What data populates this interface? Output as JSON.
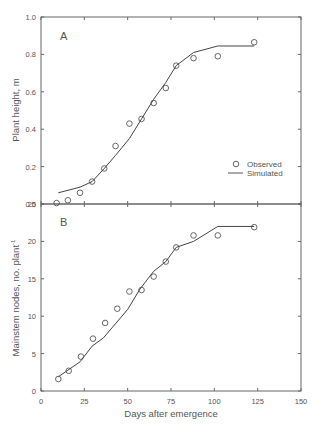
{
  "chart_data": [
    {
      "panel": "A",
      "type": "scatter+line",
      "ylabel": "Plant height, m",
      "xlabel": "Days after emergence",
      "xlim": [
        0,
        150
      ],
      "ylim": [
        0,
        1.0
      ],
      "yticks": [
        "0.0",
        "0.2",
        "0.4",
        "0.6",
        "0.8",
        "1.0"
      ],
      "xticks": [
        "0",
        "25",
        "50",
        "75",
        "100",
        "125",
        "150"
      ],
      "legend": {
        "observed": "Observed",
        "simulated": "Simulated",
        "position": "lower right"
      },
      "series": [
        {
          "name": "Observed",
          "marker": "circle",
          "x": [
            9,
            15.5,
            22.5,
            29.5,
            36.5,
            43,
            51,
            58,
            65,
            72,
            78,
            88,
            102,
            123
          ],
          "y": [
            0.005,
            0.02,
            0.06,
            0.12,
            0.19,
            0.31,
            0.43,
            0.455,
            0.54,
            0.62,
            0.74,
            0.78,
            0.79,
            0.865
          ]
        },
        {
          "name": "Simulated",
          "marker": "line",
          "x": [
            10,
            22.5,
            29.5,
            36.5,
            43,
            51,
            58,
            65,
            72,
            78,
            88,
            102,
            123
          ],
          "y": [
            0.06,
            0.09,
            0.12,
            0.19,
            0.26,
            0.35,
            0.455,
            0.56,
            0.65,
            0.74,
            0.81,
            0.845,
            0.845
          ]
        }
      ]
    },
    {
      "panel": "B",
      "type": "scatter+line",
      "ylabel": "Mainstem nodes, no. plant",
      "ylabel_sup": "-1",
      "xlabel": "Days after emergence",
      "xlim": [
        0,
        150
      ],
      "ylim": [
        0,
        25
      ],
      "yticks": [
        "0",
        "5",
        "10",
        "15",
        "20",
        "25"
      ],
      "xticks": [
        "0",
        "25",
        "50",
        "75",
        "100",
        "125",
        "150"
      ],
      "series": [
        {
          "name": "Observed",
          "marker": "circle",
          "x": [
            10,
            16,
            23,
            30,
            37,
            44,
            51,
            58,
            65,
            72,
            78,
            88,
            102,
            123
          ],
          "y": [
            1.6,
            2.7,
            4.6,
            7.0,
            9.1,
            11.0,
            13.3,
            13.5,
            15.3,
            17.3,
            19.2,
            20.8,
            20.8,
            21.9
          ]
        },
        {
          "name": "Simulated",
          "marker": "line",
          "x": [
            10,
            22.5,
            29.5,
            36,
            50,
            57,
            65,
            72,
            78,
            88,
            102,
            123
          ],
          "y": [
            1.9,
            3.9,
            6.0,
            7.1,
            10.9,
            13.6,
            16.0,
            17.3,
            19.2,
            20.0,
            22.0,
            22.0
          ]
        }
      ]
    }
  ],
  "labels": {
    "panel_a": "A",
    "panel_b": "B",
    "xlabel": "Days after emergence",
    "ylabel_a": "Plant height, m",
    "ylabel_b": "Mainstem nodes, no. plant",
    "ylabel_b_sup": "-1",
    "legend_observed": "Observed",
    "legend_simulated": "Simulated"
  }
}
